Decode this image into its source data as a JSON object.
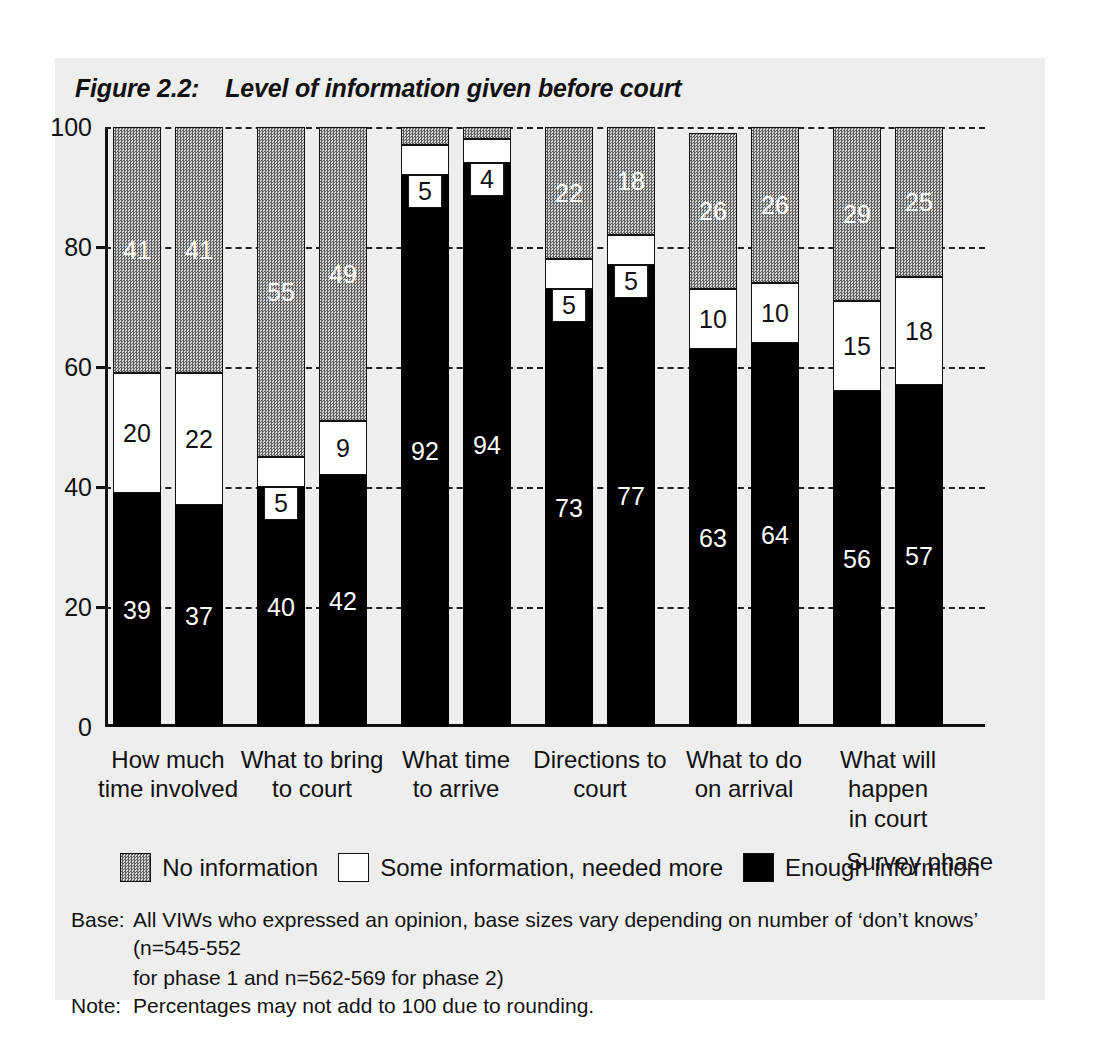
{
  "figure": {
    "number": "Figure 2.2:",
    "title": "Level of information given before court"
  },
  "axis": {
    "x_axis_title": "Survey phase",
    "y_ticks": [
      "0",
      "20",
      "40",
      "60",
      "80",
      "100"
    ]
  },
  "legend": {
    "items": [
      {
        "key": "none",
        "label": "No information"
      },
      {
        "key": "some",
        "label": "Some information, needed more"
      },
      {
        "key": "enough",
        "label": "Enough informtion"
      }
    ]
  },
  "footnotes": [
    {
      "key": "Base:",
      "text": "All VIWs who expressed an opinion, base sizes vary depending on number of ‘don’t knows’ (n=545-552",
      "cont": "for phase 1 and n=562-569 for phase 2)"
    },
    {
      "key": "Note:",
      "text": "Percentages may not add to 100 due to rounding.",
      "cont": ""
    }
  ],
  "chart_data": {
    "type": "bar",
    "subtype": "stacked-bar-100pct",
    "title": "Level of information given before court",
    "xlabel": "Survey phase",
    "ylabel": "",
    "ylim": [
      0,
      100
    ],
    "yticks": [
      0,
      20,
      40,
      60,
      80,
      100
    ],
    "grid": "horizontal-dashed",
    "legend_position": "bottom-center",
    "categories": [
      "How much time involved",
      "What to bring to court",
      "What time to arrive",
      "Directions to court",
      "What to do on arrival",
      "What will happen in court"
    ],
    "category_lines": [
      [
        "How much",
        "time involved"
      ],
      [
        "What to bring",
        "to court"
      ],
      [
        "What time",
        "to arrive"
      ],
      [
        "Directions to",
        "court"
      ],
      [
        "What to do",
        "on arrival"
      ],
      [
        "What will happen",
        "in court"
      ]
    ],
    "groups": [
      {
        "phase": "phase 1"
      },
      {
        "phase": "phase 2"
      }
    ],
    "series": [
      {
        "name": "Enough informtion",
        "key": "enough",
        "color": "#000000",
        "values": [
          [
            39,
            37
          ],
          [
            40,
            42
          ],
          [
            92,
            94
          ],
          [
            73,
            77
          ],
          [
            63,
            64
          ],
          [
            56,
            57
          ]
        ]
      },
      {
        "name": "Some information, needed more",
        "key": "some",
        "color": "#ffffff",
        "values": [
          [
            20,
            22
          ],
          [
            5,
            9
          ],
          [
            5,
            4
          ],
          [
            5,
            5
          ],
          [
            10,
            10
          ],
          [
            15,
            18
          ]
        ]
      },
      {
        "name": "No information",
        "key": "none",
        "color": "#6b6b6b",
        "values": [
          [
            41,
            41
          ],
          [
            55,
            49
          ],
          [
            3,
            2
          ],
          [
            22,
            18
          ],
          [
            26,
            26
          ],
          [
            29,
            25
          ]
        ]
      }
    ],
    "bars": [
      {
        "group": 0,
        "phase": 0,
        "enough": 39,
        "some": 20,
        "none": 41,
        "labels": {
          "enough": "39",
          "some": "20",
          "none": "41"
        }
      },
      {
        "group": 0,
        "phase": 1,
        "enough": 37,
        "some": 22,
        "none": 41,
        "labels": {
          "enough": "37",
          "some": "22",
          "none": "41"
        }
      },
      {
        "group": 1,
        "phase": 0,
        "enough": 40,
        "some": 5,
        "none": 55,
        "labels": {
          "enough": "40",
          "some": "5",
          "none": "55"
        }
      },
      {
        "group": 1,
        "phase": 1,
        "enough": 42,
        "some": 9,
        "none": 49,
        "labels": {
          "enough": "42",
          "some": "9",
          "none": "49"
        }
      },
      {
        "group": 2,
        "phase": 0,
        "enough": 92,
        "some": 5,
        "none": 3,
        "labels": {
          "enough": "92",
          "some": "5",
          "none": ""
        }
      },
      {
        "group": 2,
        "phase": 1,
        "enough": 94,
        "some": 4,
        "none": 2,
        "labels": {
          "enough": "94",
          "some": "4",
          "none": ""
        }
      },
      {
        "group": 3,
        "phase": 0,
        "enough": 73,
        "some": 5,
        "none": 22,
        "labels": {
          "enough": "73",
          "some": "5",
          "none": "22"
        }
      },
      {
        "group": 3,
        "phase": 1,
        "enough": 77,
        "some": 5,
        "none": 18,
        "labels": {
          "enough": "77",
          "some": "5",
          "none": "18"
        }
      },
      {
        "group": 4,
        "phase": 0,
        "enough": 63,
        "some": 10,
        "none": 26,
        "labels": {
          "enough": "63",
          "some": "10",
          "none": "26"
        }
      },
      {
        "group": 4,
        "phase": 1,
        "enough": 64,
        "some": 10,
        "none": 26,
        "labels": {
          "enough": "64",
          "some": "10",
          "none": "26"
        }
      },
      {
        "group": 5,
        "phase": 0,
        "enough": 56,
        "some": 15,
        "none": 29,
        "labels": {
          "enough": "56",
          "some": "15",
          "none": "29"
        }
      },
      {
        "group": 5,
        "phase": 1,
        "enough": 57,
        "some": 18,
        "none": 25,
        "labels": {
          "enough": "57",
          "some": "18",
          "none": "25"
        }
      }
    ]
  }
}
